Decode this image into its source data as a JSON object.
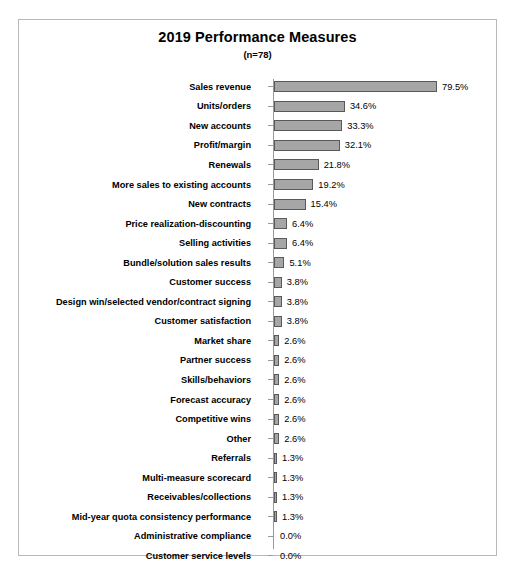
{
  "chart_data": {
    "type": "bar",
    "orientation": "horizontal",
    "title": "2019 Performance Measures",
    "subtitle": "(n=78)",
    "xlabel": "",
    "ylabel": "",
    "xlim": [
      0,
      79.5
    ],
    "grid": false,
    "legend": null,
    "value_suffix": "%",
    "bar_fill_color": "#a6a6a6",
    "bar_border_color": "#595959",
    "axis_color": "#9a9a9a",
    "frame_color": "#b8b8b8",
    "text_color": "#000000",
    "categories": [
      "Sales revenue",
      "Units/orders",
      "New accounts",
      "Profit/margin",
      "Renewals",
      "More sales to existing accounts",
      "New contracts",
      "Price realization-discounting",
      "Selling activities",
      "Bundle/solution sales results",
      "Customer success",
      "Design win/selected vendor/contract signing",
      "Customer satisfaction",
      "Market share",
      "Partner success",
      "Skills/behaviors",
      "Forecast accuracy",
      "Competitive wins",
      "Other",
      "Referrals",
      "Multi-measure scorecard",
      "Receivables/collections",
      "Mid-year quota consistency performance",
      "Administrative compliance",
      "Customer service levels"
    ],
    "values": [
      79.5,
      34.6,
      33.3,
      32.1,
      21.8,
      19.2,
      15.4,
      6.4,
      6.4,
      5.1,
      3.8,
      3.8,
      3.8,
      2.6,
      2.6,
      2.6,
      2.6,
      2.6,
      2.6,
      1.3,
      1.3,
      1.3,
      1.3,
      0.0,
      0.0
    ],
    "value_labels": [
      "79.5%",
      "34.6%",
      "33.3%",
      "32.1%",
      "21.8%",
      "19.2%",
      "15.4%",
      "6.4%",
      "6.4%",
      "5.1%",
      "3.8%",
      "3.8%",
      "3.8%",
      "2.6%",
      "2.6%",
      "2.6%",
      "2.6%",
      "2.6%",
      "2.6%",
      "1.3%",
      "1.3%",
      "1.3%",
      "1.3%",
      "0.0%",
      "0.0%"
    ]
  }
}
